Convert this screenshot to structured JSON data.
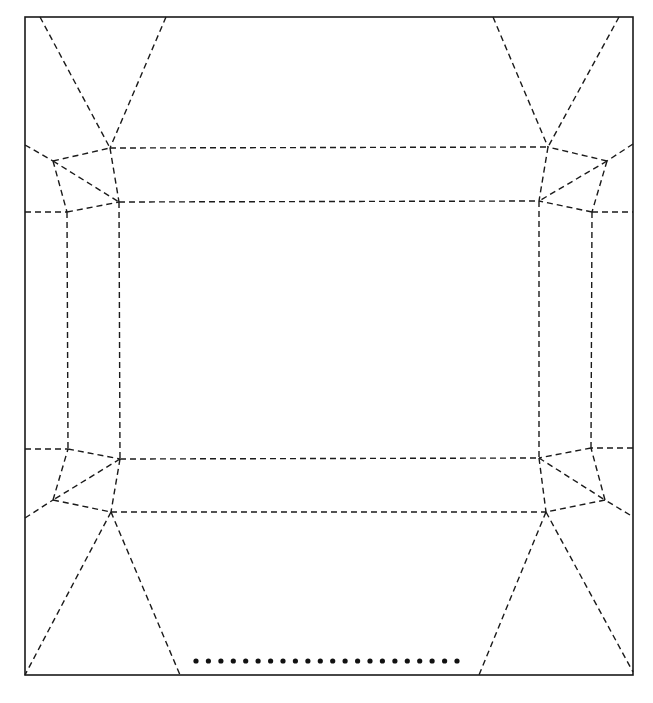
{
  "diagram": {
    "type": "crease-pattern",
    "paper": {
      "x": 25,
      "y": 17,
      "width": 608,
      "height": 658,
      "stroke": "#1a1a1a"
    },
    "line_color": "#1a1a1a",
    "creases": [
      [
        40,
        17,
        110,
        148
      ],
      [
        166,
        17,
        110,
        148
      ],
      [
        619,
        17,
        548,
        147
      ],
      [
        493,
        17,
        548,
        147
      ],
      [
        110,
        148,
        548,
        147
      ],
      [
        119,
        202,
        539,
        201
      ],
      [
        110,
        148,
        119,
        202
      ],
      [
        548,
        147,
        539,
        201
      ],
      [
        25,
        145,
        53,
        161
      ],
      [
        53,
        161,
        110,
        148
      ],
      [
        53,
        161,
        119,
        202
      ],
      [
        53,
        161,
        67,
        212
      ],
      [
        67,
        212,
        119,
        202
      ],
      [
        25,
        212,
        67,
        212
      ],
      [
        633,
        144,
        607,
        161
      ],
      [
        607,
        161,
        548,
        147
      ],
      [
        607,
        161,
        539,
        201
      ],
      [
        607,
        161,
        592,
        212
      ],
      [
        592,
        212,
        539,
        201
      ],
      [
        592,
        212,
        633,
        212
      ],
      [
        67,
        212,
        68,
        449
      ],
      [
        119,
        202,
        120,
        459
      ],
      [
        539,
        201,
        539,
        458
      ],
      [
        592,
        212,
        591,
        448
      ],
      [
        25,
        449,
        68,
        449
      ],
      [
        68,
        449,
        120,
        459
      ],
      [
        120,
        459,
        53,
        500
      ],
      [
        53,
        500,
        68,
        449
      ],
      [
        53,
        500,
        111,
        512
      ],
      [
        25,
        518,
        53,
        500
      ],
      [
        633,
        448,
        591,
        448
      ],
      [
        591,
        448,
        539,
        458
      ],
      [
        539,
        458,
        605,
        500
      ],
      [
        605,
        500,
        591,
        448
      ],
      [
        605,
        500,
        546,
        512
      ],
      [
        630,
        515,
        605,
        500
      ],
      [
        120,
        459,
        539,
        458
      ],
      [
        111,
        512,
        546,
        512
      ],
      [
        120,
        459,
        111,
        512
      ],
      [
        539,
        458,
        546,
        512
      ],
      [
        111,
        512,
        25,
        675
      ],
      [
        111,
        512,
        180,
        675
      ],
      [
        546,
        512,
        479,
        675
      ],
      [
        546,
        512,
        633,
        672
      ]
    ],
    "dot_row": {
      "count": 22,
      "x_start": 196,
      "x_end": 457,
      "y": 661,
      "radius": 2.6,
      "color": "#111111"
    }
  }
}
